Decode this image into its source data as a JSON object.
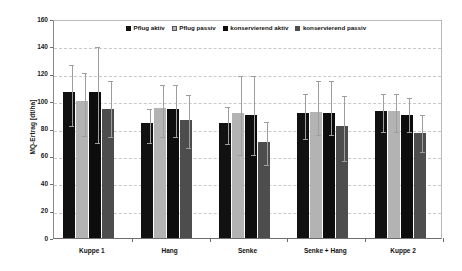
{
  "chart_data": {
    "type": "bar",
    "title": "",
    "xlabel": "",
    "ylabel": "MQ-Ertrag [dt/ha]",
    "ylim": [
      0,
      160
    ],
    "ytick_step": 20,
    "yticks": [
      0,
      20,
      40,
      60,
      80,
      100,
      120,
      140,
      160
    ],
    "grid": true,
    "legend_position": "top-center",
    "categories": [
      "Kuppe 1",
      "Hang",
      "Senke",
      "Senke + Hang",
      "Kuppe 2"
    ],
    "series": [
      {
        "name": "Pflug aktiv",
        "color": "#111111",
        "values": [
          107,
          84,
          84,
          91,
          93
        ],
        "err_low": [
          83,
          71,
          70,
          74,
          79
        ],
        "err_high": [
          128,
          96,
          97,
          107,
          107
        ]
      },
      {
        "name": "Pflug passiv",
        "color": "#b3b3b3",
        "values": [
          100,
          95,
          91,
          92,
          93
        ],
        "err_low": [
          76,
          75,
          62,
          77,
          79
        ],
        "err_high": [
          122,
          113,
          120,
          116,
          107
        ]
      },
      {
        "name": "konservierend aktiv",
        "color": "#0d0d0d",
        "values": [
          107,
          94,
          90,
          91,
          90
        ],
        "err_low": [
          71,
          75,
          62,
          77,
          79
        ],
        "err_high": [
          141,
          113,
          120,
          116,
          104
        ]
      },
      {
        "name": "konservierend passiv",
        "color": "#4d4d4d",
        "values": [
          94,
          86,
          70,
          82,
          77
        ],
        "err_low": [
          75,
          67,
          55,
          58,
          64
        ],
        "err_high": [
          116,
          106,
          86,
          105,
          91
        ]
      }
    ]
  },
  "axis": {
    "y_title": "MQ-Ertrag [dt/ha]"
  },
  "legend": {
    "items": [
      {
        "label": "Pflug aktiv"
      },
      {
        "label": "Pflug passiv"
      },
      {
        "label": "konservierend aktiv"
      },
      {
        "label": "konservierend passiv"
      }
    ]
  }
}
